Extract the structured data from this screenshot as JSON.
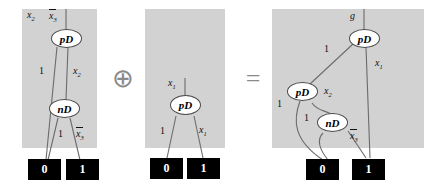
{
  "figure": {
    "operators": {
      "plus": "⊕",
      "equals": "="
    },
    "panels": [
      {
        "id": "operand-a",
        "nodes": [
          {
            "id": "a-pd",
            "label": "pD"
          },
          {
            "id": "a-nd",
            "label": "nD"
          }
        ],
        "terminals": [
          {
            "id": "a-t0",
            "label": "0"
          },
          {
            "id": "a-t1",
            "label": "1"
          }
        ],
        "top_labels": [
          {
            "id": "a-top-x2",
            "text": "x",
            "sub": "2",
            "overline": false
          },
          {
            "id": "a-top-x3bar",
            "text": "x",
            "sub": "3",
            "overline": true
          }
        ],
        "edge_labels": [
          {
            "id": "a-e1",
            "text": "1",
            "sub": "",
            "overline": false
          },
          {
            "id": "a-e2",
            "text": "x",
            "sub": "2",
            "overline": false
          },
          {
            "id": "a-e3",
            "text": "1",
            "sub": "",
            "overline": false
          },
          {
            "id": "a-e4",
            "text": "x",
            "sub": "3",
            "overline": true
          }
        ]
      },
      {
        "id": "operand-b",
        "nodes": [
          {
            "id": "b-pd",
            "label": "pD"
          }
        ],
        "terminals": [
          {
            "id": "b-t0",
            "label": "0"
          },
          {
            "id": "b-t1",
            "label": "1"
          }
        ],
        "top_labels": [
          {
            "id": "b-top-x1",
            "text": "x",
            "sub": "1",
            "overline": false
          }
        ],
        "edge_labels": [
          {
            "id": "b-e1",
            "text": "1",
            "sub": "",
            "overline": false
          },
          {
            "id": "b-e2",
            "text": "x",
            "sub": "1",
            "overline": false
          }
        ]
      },
      {
        "id": "result",
        "nodes": [
          {
            "id": "c-pd-root",
            "label": "pD"
          },
          {
            "id": "c-pd-left",
            "label": "pD"
          },
          {
            "id": "c-nd",
            "label": "nD"
          }
        ],
        "terminals": [
          {
            "id": "c-t0",
            "label": "0"
          },
          {
            "id": "c-t1",
            "label": "1"
          }
        ],
        "top_labels": [
          {
            "id": "c-top-g",
            "text": "g",
            "sub": "",
            "overline": false
          }
        ],
        "edge_labels": [
          {
            "id": "c-e1",
            "text": "1",
            "sub": "",
            "overline": false
          },
          {
            "id": "c-e2",
            "text": "x",
            "sub": "1",
            "overline": false
          },
          {
            "id": "c-e3",
            "text": "1",
            "sub": "",
            "overline": false
          },
          {
            "id": "c-e4",
            "text": "x",
            "sub": "2",
            "overline": false
          },
          {
            "id": "c-e5",
            "text": "1",
            "sub": "",
            "overline": false
          },
          {
            "id": "c-e6",
            "text": "x",
            "sub": "3",
            "overline": true
          }
        ]
      }
    ]
  }
}
